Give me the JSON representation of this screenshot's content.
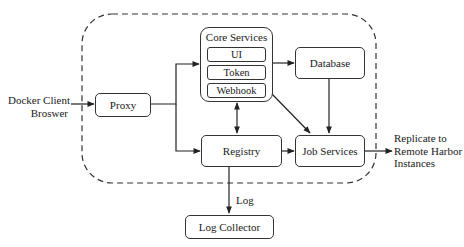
{
  "diagram": {
    "external": {
      "client_lines": [
        "Docker Client",
        "Broswer"
      ],
      "replicate_lines": [
        "Replicate to",
        "Remote Harbor",
        "Instances"
      ],
      "log_edge_label": "Log"
    },
    "nodes": {
      "proxy": "Proxy",
      "core_services": {
        "title": "Core Services",
        "components": [
          "UI",
          "Token",
          "Webhook"
        ]
      },
      "database": "Database",
      "registry": "Registry",
      "job_services": "Job Services",
      "log_collector": "Log Collector"
    },
    "edges": [
      {
        "from": "Docker Client Broswer",
        "to": "Proxy"
      },
      {
        "from": "Proxy",
        "to": "Core Services"
      },
      {
        "from": "Proxy",
        "to": "Registry"
      },
      {
        "from": "Core Services",
        "to": "Database"
      },
      {
        "from": "Core Services",
        "to": "Registry",
        "bidirectional": true
      },
      {
        "from": "Core Services",
        "to": "Job Services"
      },
      {
        "from": "Database",
        "to": "Job Services"
      },
      {
        "from": "Registry",
        "to": "Job Services"
      },
      {
        "from": "Registry",
        "to": "Log Collector",
        "label": "Log"
      },
      {
        "from": "Job Services",
        "to": "Replicate to Remote Harbor Instances"
      }
    ],
    "boundary": "dashed rounded rectangle enclosing Proxy, Core Services, Database, Registry, Job Services",
    "colors": {
      "stroke": "#333333",
      "background": "#ffffff",
      "text": "#1a1a1a"
    }
  }
}
